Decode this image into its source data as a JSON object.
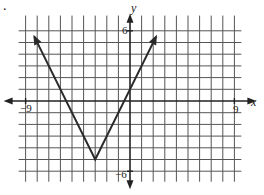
{
  "problem_marker": ".",
  "chart_data": {
    "type": "line",
    "title": "",
    "xlabel": "x",
    "ylabel": "y",
    "xlim": [
      -9,
      9
    ],
    "ylim": [
      -6,
      6
    ],
    "grid": true,
    "tick_labels": {
      "x_min": "−9",
      "x_max": "9",
      "y_max": "6",
      "y_min": "−6"
    },
    "function": "y = 2|x + 3| - 5",
    "vertex": [
      -3,
      -5
    ],
    "series": [
      {
        "name": "absolute value graph",
        "x": [
          -8.25,
          -3,
          2.25
        ],
        "y": [
          5.5,
          -5,
          5.5
        ]
      }
    ],
    "arrows_on_ends": true
  },
  "colors": {
    "line": "#2a2a2a",
    "grid": "#555555",
    "axis": "#222222"
  }
}
